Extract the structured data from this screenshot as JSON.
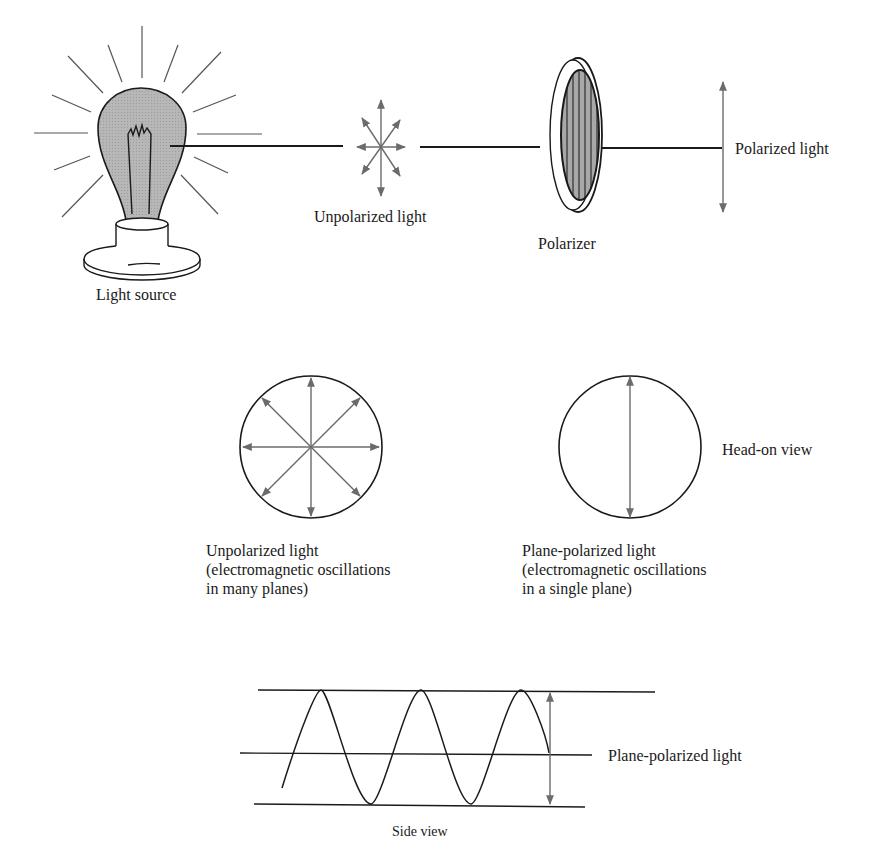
{
  "colors": {
    "ink": "#1a1a1a",
    "arrow_gray": "#6b6b6b",
    "bulb_fill": "#b3b3b3",
    "filter_fill": "#9e9e9e",
    "background": "#ffffff"
  },
  "top_row": {
    "light_source": {
      "label": "Light source",
      "icon": "light-bulb-icon"
    },
    "unpolarized": {
      "label": "Unpolarized light",
      "icon": "multi-direction-arrows-icon"
    },
    "polarizer": {
      "label": "Polarizer",
      "icon": "polarizer-filter-icon"
    },
    "polarized": {
      "label": "Polarized light",
      "icon": "vertical-double-arrow-icon"
    }
  },
  "head_on_row": {
    "view_label": "Head-on view",
    "unpolarized": {
      "title": "Unpolarized light",
      "description": "(electromagnetic oscillations\nin many planes)"
    },
    "plane_polarized": {
      "title": "Plane-polarized light",
      "description": "(electromagnetic oscillations\nin a single plane)"
    }
  },
  "side_row": {
    "wave_label": "Plane-polarized light",
    "view_label": "Side view"
  }
}
